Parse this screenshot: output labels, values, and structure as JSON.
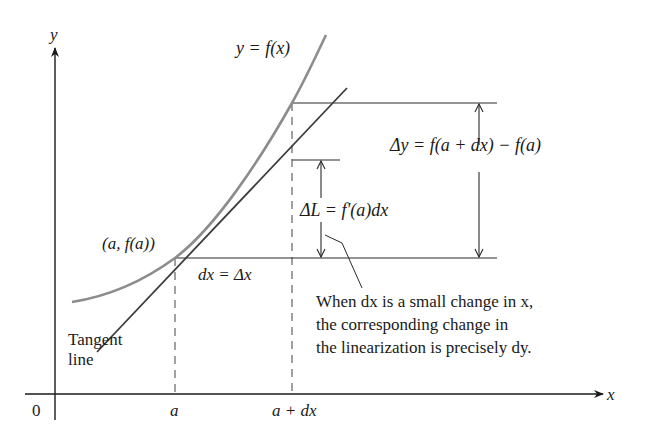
{
  "figure": {
    "colors": {
      "axis": "#1a1a1a",
      "curve": "#8c8c8c",
      "tangent": "#3c3c3c",
      "guide": "#2a2a2a",
      "dashed": "#555555",
      "background": "#ffffff"
    },
    "axes": {
      "x_label": "x",
      "y_label": "y",
      "origin_label": "0",
      "x_ticks": [
        "a",
        "a + dx"
      ]
    },
    "curve_label": "y = f(x)",
    "point_label": "(a, f(a))",
    "dx_label": "dx = Δx",
    "delta_y_label": "Δy = f(a + dx) − f(a)",
    "delta_L_label": "ΔL = f′(a)dx",
    "tangent_label": [
      "Tangent",
      "line"
    ],
    "note_lines": [
      "When dx is a small change in x,",
      "the corresponding change in",
      "the linearization is precisely dy."
    ]
  }
}
